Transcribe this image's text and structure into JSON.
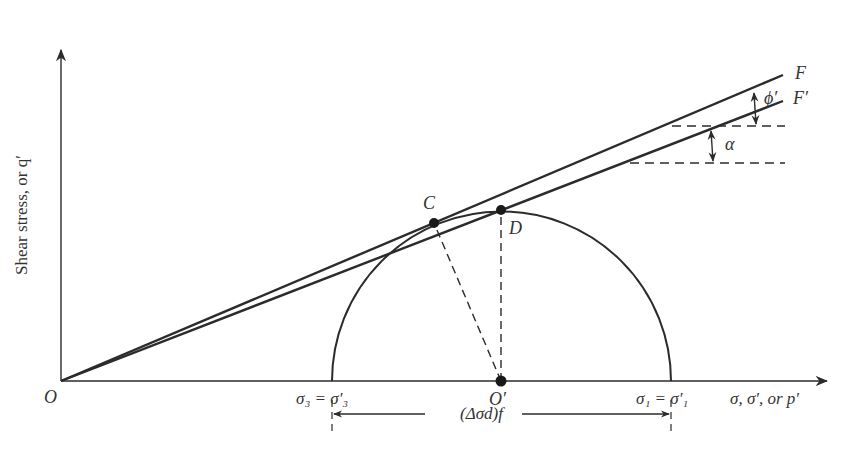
{
  "diagram": {
    "y_axis_label": "Shear stress, or q′",
    "x_axis_label": "σ, σ′, or p′",
    "origin_label": "O",
    "center_label": "O′",
    "point_c_label": "C",
    "point_d_label": "D",
    "envelope_f_label": "F",
    "envelope_f_prime_label": "F′",
    "angle_phi_label": "ϕ′",
    "angle_alpha_label": "α",
    "sigma3_label": "σ₃ = σ′₃",
    "sigma1_label": "σ₁ = σ′₁",
    "deviator_label": "(Δσd)f",
    "colors": {
      "line": "#2b2b2b",
      "text": "#333333",
      "background": "#ffffff"
    }
  }
}
